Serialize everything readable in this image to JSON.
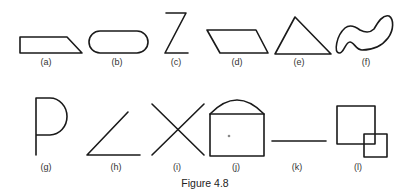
{
  "figure": {
    "caption": "Figure 4.8",
    "row1": [
      {
        "id": "a",
        "label": "(a)",
        "shape": "right trapezoid"
      },
      {
        "id": "b",
        "label": "(b)",
        "shape": "rounded rectangle / stadium"
      },
      {
        "id": "c",
        "label": "(c)",
        "shape": "Z"
      },
      {
        "id": "d",
        "label": "(d)",
        "shape": "parallelogram"
      },
      {
        "id": "e",
        "label": "(e)",
        "shape": "triangle"
      },
      {
        "id": "f",
        "label": "(f)",
        "shape": "irregular closed curve"
      }
    ],
    "row2": [
      {
        "id": "g",
        "label": "(g)",
        "shape": "P"
      },
      {
        "id": "h",
        "label": "(h)",
        "shape": "angle"
      },
      {
        "id": "i",
        "label": "(i)",
        "shape": "X / crossing lines"
      },
      {
        "id": "j",
        "label": "(j)",
        "shape": "rectangle with arc top"
      },
      {
        "id": "k",
        "label": "(k)",
        "shape": "line segment"
      },
      {
        "id": "l",
        "label": "(l)",
        "shape": "overlapping squares"
      }
    ]
  }
}
